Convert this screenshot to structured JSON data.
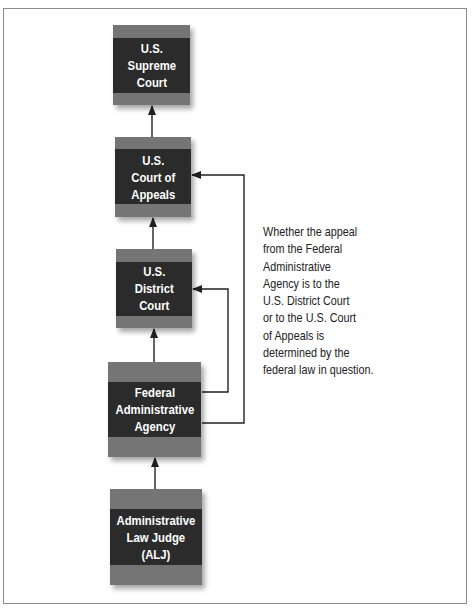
{
  "diagram": {
    "colors": {
      "box_dark": "#2b2b2b",
      "box_band": "#757575",
      "box_text": "#ffffff",
      "line": "#222222",
      "frame": "#8c8c8c"
    },
    "boxes": [
      {
        "id": "supreme-court",
        "lines": [
          "U.S.",
          "Supreme",
          "Court"
        ]
      },
      {
        "id": "court-of-appeals",
        "lines": [
          "U.S.",
          "Court of",
          "Appeals"
        ]
      },
      {
        "id": "district-court",
        "lines": [
          "U.S.",
          "District",
          "Court"
        ]
      },
      {
        "id": "federal-administrative-agency",
        "lines": [
          "Federal",
          "Administrative",
          "Agency"
        ]
      },
      {
        "id": "administrative-law-judge",
        "lines": [
          "Administrative",
          "Law Judge",
          "(ALJ)"
        ]
      }
    ],
    "connections": [
      {
        "from": "court-of-appeals",
        "to": "supreme-court"
      },
      {
        "from": "district-court",
        "to": "court-of-appeals"
      },
      {
        "from": "federal-administrative-agency",
        "to": "district-court"
      },
      {
        "from": "administrative-law-judge",
        "to": "federal-administrative-agency"
      },
      {
        "from": "federal-administrative-agency",
        "to": "court-of-appeals"
      }
    ],
    "note": {
      "lines": [
        "Whether the appeal",
        "from the Federal",
        "Administrative",
        "Agency is to the",
        "U.S. District Court",
        "or to the U.S. Court",
        "of Appeals is",
        "determined by the",
        "federal law in question."
      ]
    }
  }
}
